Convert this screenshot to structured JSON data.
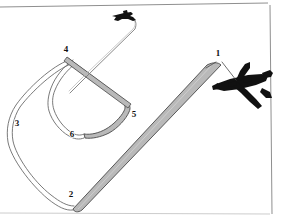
{
  "figure": {
    "background_color": "#ffffff",
    "border_color": "#9a9a9a",
    "line_color": "#555555",
    "ribbon_fill": "#b9b9b9",
    "ribbon_stroke": "#4a4a4a",
    "aircraft_color": "#111111",
    "callouts": [
      {
        "id": "1",
        "label": "1",
        "x": 218,
        "y": 56
      },
      {
        "id": "2",
        "label": "2",
        "x": 71,
        "y": 197
      },
      {
        "id": "3",
        "label": "3",
        "x": 17,
        "y": 126
      },
      {
        "id": "4",
        "label": "4",
        "x": 66,
        "y": 52
      },
      {
        "id": "5",
        "label": "5",
        "x": 134,
        "y": 117
      },
      {
        "id": "6",
        "label": "6",
        "x": 72,
        "y": 137
      }
    ],
    "aircraft": [
      {
        "name": "tug-aircraft-large",
        "role": "towing aircraft",
        "x": 244,
        "y": 88
      },
      {
        "name": "tug-aircraft-small",
        "role": "distant aircraft",
        "x": 124,
        "y": 16
      }
    ]
  }
}
